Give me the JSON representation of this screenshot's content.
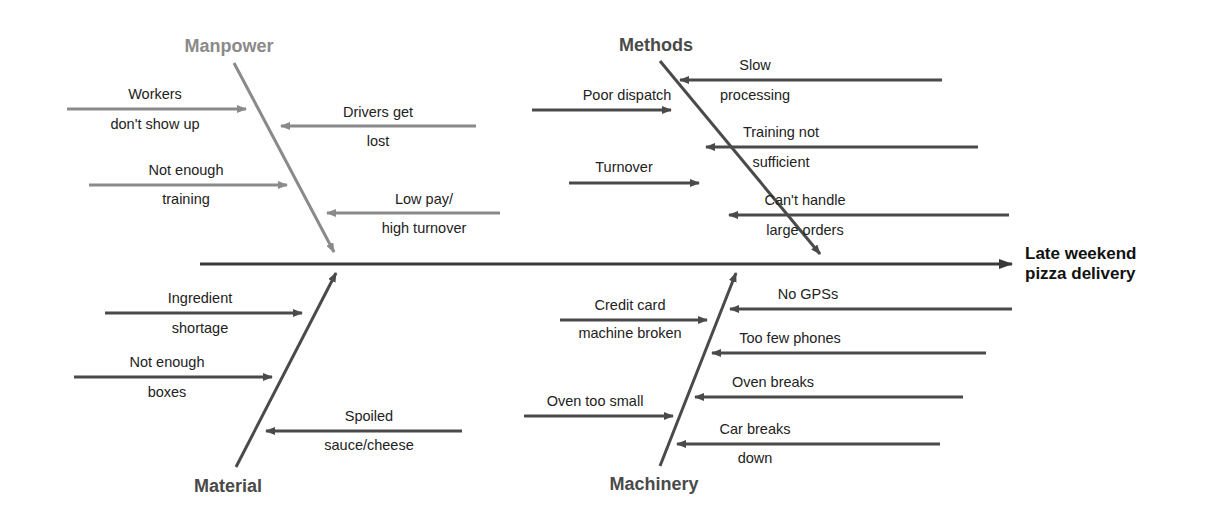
{
  "effect": {
    "line1": "Late weekend",
    "line2": "pizza delivery"
  },
  "colors": {
    "spine": "#3a3a3a",
    "manpower_bone": "#8a8a8a",
    "dark_bone": "#4a4a4a",
    "text": "#222222",
    "background": "#ffffff"
  },
  "categories": [
    {
      "name": "Manpower",
      "causes": [
        {
          "line1": "Workers",
          "line2": "don't show up"
        },
        {
          "line1": "Drivers get",
          "line2": "lost"
        },
        {
          "line1": "Not enough",
          "line2": "training"
        },
        {
          "line1": "Low pay/",
          "line2": "high turnover"
        }
      ]
    },
    {
      "name": "Methods",
      "causes": [
        {
          "line1": "Slow",
          "line2": "processing"
        },
        {
          "line1": "Poor dispatch",
          "line2": ""
        },
        {
          "line1": "Training not",
          "line2": "sufficient"
        },
        {
          "line1": "Turnover",
          "line2": ""
        },
        {
          "line1": "Can't handle",
          "line2": "large orders"
        }
      ]
    },
    {
      "name": "Material",
      "causes": [
        {
          "line1": "Ingredient",
          "line2": "shortage"
        },
        {
          "line1": "Not enough",
          "line2": "boxes"
        },
        {
          "line1": "Spoiled",
          "line2": "sauce/cheese"
        }
      ]
    },
    {
      "name": "Machinery",
      "causes": [
        {
          "line1": "No GPSs",
          "line2": ""
        },
        {
          "line1": "Credit card",
          "line2": "machine broken"
        },
        {
          "line1": "Too few phones",
          "line2": ""
        },
        {
          "line1": "Oven breaks",
          "line2": ""
        },
        {
          "line1": "Oven too small",
          "line2": ""
        },
        {
          "line1": "Car breaks",
          "line2": "down"
        }
      ]
    }
  ]
}
